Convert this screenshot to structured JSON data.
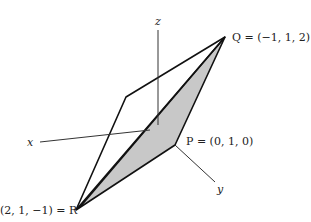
{
  "diagram": {
    "axes": {
      "x_label": "x",
      "y_label": "y",
      "z_label": "z"
    },
    "points": {
      "P": {
        "name": "P",
        "coords": "(0, 1, 0)",
        "label": "P = (0, 1, 0)"
      },
      "Q": {
        "name": "Q",
        "coords": "(−1, 1, 2)",
        "label": "Q = (−1, 1, 2)"
      },
      "R": {
        "name": "R",
        "coords": "(2, 1, −1)",
        "label": "(2, 1, −1) = R"
      }
    },
    "colors": {
      "line": "#111111",
      "axis": "#333333",
      "shade": "#c8c8c8"
    }
  }
}
